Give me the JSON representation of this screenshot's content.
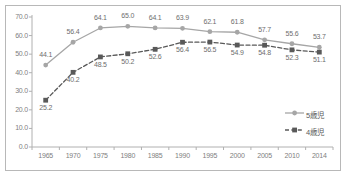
{
  "chart_data": {
    "type": "line",
    "title": "",
    "subtitle": "",
    "xlabel": "",
    "ylabel": "",
    "categories": [
      "1965",
      "1970",
      "1975",
      "1980",
      "1985",
      "1990",
      "1995",
      "2000",
      "2005",
      "2010",
      "2014"
    ],
    "ylim": [
      0.0,
      70.0
    ],
    "yticks": [
      "0.0",
      "10.0",
      "20.0",
      "30.0",
      "40.0",
      "50.0",
      "60.0",
      "70.0"
    ],
    "grid": false,
    "legend_position": "right-inside",
    "series": [
      {
        "name": "5歳児",
        "marker": "circle",
        "line_style": "solid",
        "color": "#a6a6a6",
        "values": [
          44.1,
          56.4,
          64.1,
          65.0,
          64.1,
          63.9,
          62.1,
          61.8,
          57.7,
          55.6,
          53.7
        ],
        "labels": [
          "44.1",
          "56.4",
          "64.1",
          "65.0",
          "64.1",
          "63.9",
          "62.1",
          "61.8",
          "57.7",
          "55.6",
          "53.7"
        ]
      },
      {
        "name": "4歳児",
        "marker": "square",
        "line_style": "dashed",
        "color": "#595959",
        "values": [
          25.2,
          40.2,
          48.5,
          50.2,
          52.6,
          56.4,
          56.5,
          54.9,
          54.8,
          52.3,
          51.1
        ],
        "labels": [
          "25.2",
          "40.2",
          "48.5",
          "50.2",
          "52.6",
          "56.4",
          "56.5",
          "54.9",
          "54.8",
          "52.3",
          "51.1"
        ]
      }
    ]
  },
  "legend": {
    "items": [
      {
        "label": "5歳児"
      },
      {
        "label": "4歳児"
      }
    ]
  },
  "axis_colors": {
    "axis_line": "#b0b0b0",
    "frame": "#b8b8b8",
    "tick_text": "#808080",
    "label_text": "#6e6e6e"
  }
}
